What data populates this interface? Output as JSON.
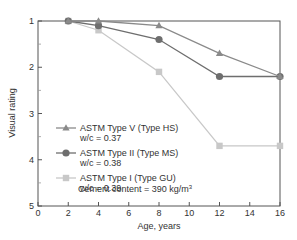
{
  "chart_data": {
    "type": "line",
    "title": "",
    "xlabel": "Age, years",
    "ylabel": "Visual rating",
    "xlim": [
      0,
      16
    ],
    "ylim": [
      1,
      5
    ],
    "y_inverted": true,
    "x_ticks": [
      0,
      2,
      4,
      6,
      8,
      10,
      12,
      14,
      16
    ],
    "y_ticks": [
      1,
      2,
      3,
      4,
      5
    ],
    "grid": false,
    "legend_position": "inside-left",
    "annotation": "Cement content = 390 kg/m³",
    "series": [
      {
        "name": "ASTM Type V (Type HS)",
        "sub": "w/c = 0.37",
        "marker": "triangle",
        "color": "#8a8a8a",
        "x": [
          2,
          4,
          8,
          12,
          16
        ],
        "y": [
          1.0,
          1.0,
          1.1,
          1.7,
          2.2
        ]
      },
      {
        "name": "ASTM Type II (Type MS)",
        "sub": "w/c = 0.38",
        "marker": "circle",
        "color": "#6e6e6e",
        "x": [
          2,
          4,
          8,
          12,
          16
        ],
        "y": [
          1.0,
          1.1,
          1.4,
          2.2,
          2.2
        ]
      },
      {
        "name": "ASTM Type I (Type GU)",
        "sub": "w/c = 0.39",
        "marker": "square",
        "color": "#c8c8c8",
        "x": [
          2,
          4,
          8,
          12,
          16
        ],
        "y": [
          1.0,
          1.2,
          2.1,
          3.7,
          3.7
        ]
      }
    ]
  }
}
